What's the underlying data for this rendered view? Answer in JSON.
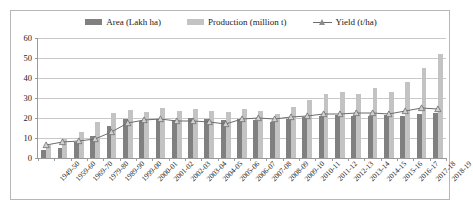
{
  "chart_data": {
    "type": "bar",
    "title": "",
    "xlabel": "",
    "ylabel": "",
    "ylim": [
      0,
      60
    ],
    "ytick_step": 10,
    "yticks": [
      0,
      10,
      20,
      30,
      40,
      50,
      60
    ],
    "grid": true,
    "legend_position": "top-center",
    "categories": [
      "1949-50",
      "1959-60",
      "1969-70",
      "1979-80",
      "1989-90",
      "1999-00",
      "2000-01",
      "2001-02",
      "2002-03",
      "2003-04",
      "2004-05",
      "2005-06",
      "2006-07",
      "2007-08",
      "2008-09",
      "2009-10",
      "2010-11",
      "2011-12",
      "2012-13",
      "2013-14",
      "2014-15",
      "2015-16",
      "2016-17",
      "2017-18",
      "2018-19"
    ],
    "series": [
      {
        "name": "Area (Lakh ha)",
        "type": "bar",
        "color": "#808080",
        "values": [
          4.0,
          5.0,
          8.0,
          11.0,
          16.0,
          19.5,
          18.5,
          19.5,
          19.0,
          20.0,
          19.5,
          19.0,
          19.5,
          19.0,
          18.0,
          19.5,
          20.5,
          21.0,
          21.5,
          21.0,
          21.0,
          21.5,
          21.0,
          22.0,
          22.5
        ]
      },
      {
        "name": "Production (million t)",
        "type": "bar",
        "color": "#c3c3c3",
        "values": [
          6.5,
          9.5,
          13.0,
          18.0,
          22.5,
          24.0,
          23.0,
          25.0,
          23.5,
          24.5,
          23.5,
          23.0,
          24.5,
          23.5,
          22.0,
          25.5,
          29.0,
          32.0,
          33.0,
          32.0,
          35.0,
          33.0,
          38.0,
          45.0,
          52.0
        ]
      },
      {
        "name": "Yield (t/ha)",
        "type": "line",
        "color": "#6d6d6d",
        "marker": "triangle",
        "values": [
          6.5,
          8.0,
          8.5,
          9.5,
          13.0,
          17.5,
          19.0,
          19.5,
          18.5,
          18.5,
          18.0,
          17.0,
          19.5,
          20.0,
          19.5,
          20.5,
          21.0,
          22.0,
          22.0,
          22.5,
          22.5,
          22.0,
          23.5,
          25.0,
          24.5
        ]
      }
    ]
  },
  "legend": {
    "items": [
      {
        "label": "Area (Lakh ha)",
        "swatch": "area-swatch",
        "color": "#808080"
      },
      {
        "label": "Production (million t)",
        "swatch": "production-swatch",
        "color": "#c3c3c3"
      },
      {
        "label": "Yield (t/ha)",
        "swatch": "yield-line-marker",
        "color": "#6d6d6d"
      }
    ]
  },
  "colors": {
    "area": "#808080",
    "production": "#c3c3c3",
    "yield": "#6d6d6d",
    "grid": "#c9c9c9",
    "axis": "#9a9a9a",
    "border": "#b6b6b6",
    "background": "#ffffff"
  }
}
